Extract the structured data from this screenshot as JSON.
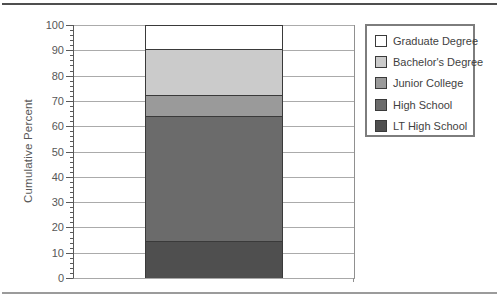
{
  "chart_data": {
    "type": "bar",
    "stacked": true,
    "ylabel": "Cumulative Percent",
    "ylim": [
      0,
      100
    ],
    "ytick_step": 10,
    "minor_ytick_step": 2,
    "grid": true,
    "yticks": [
      0,
      10,
      20,
      30,
      40,
      50,
      60,
      70,
      80,
      90,
      100
    ],
    "series": [
      {
        "name": "LT High School",
        "value": 14.5,
        "cumulative": 14.5,
        "color": "#4f4f4f"
      },
      {
        "name": "High School",
        "value": 49.5,
        "cumulative": 64.0,
        "color": "#6b6b6b"
      },
      {
        "name": "Junior College",
        "value": 8.5,
        "cumulative": 72.5,
        "color": "#9a9a9a"
      },
      {
        "name": "Bachelor's Degree",
        "value": 18.0,
        "cumulative": 90.5,
        "color": "#cbcbcb"
      },
      {
        "name": "Graduate Degree",
        "value": 9.5,
        "cumulative": 100.0,
        "color": "#ffffff"
      }
    ],
    "legend": {
      "position": "top-right",
      "items": [
        "Graduate Degree",
        "Bachelor's Degree",
        "Junior College",
        "High School",
        "LT High School"
      ]
    },
    "colors": {
      "gridline": "#ababab",
      "axis": "#5a5a5a",
      "segment_border": "#3a3a3a"
    }
  }
}
